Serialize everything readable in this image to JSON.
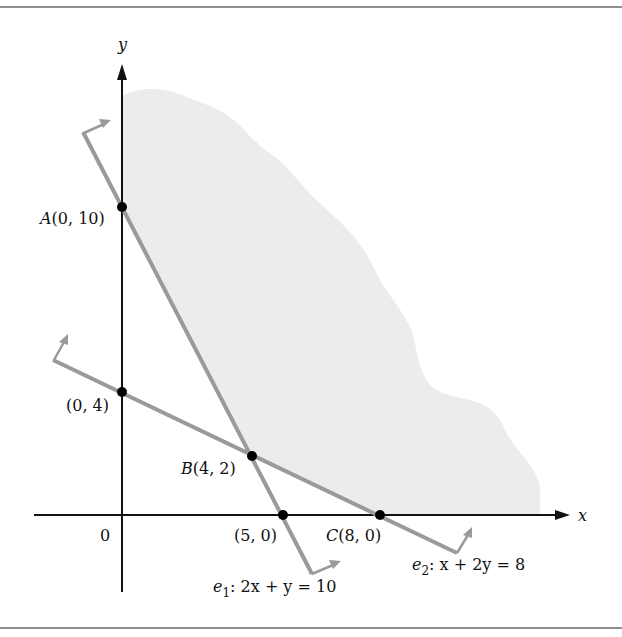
{
  "figure": {
    "axes": {
      "x_label": "x",
      "y_label": "y",
      "origin_label": "0"
    },
    "points": [
      {
        "id": "A",
        "name": "A",
        "coords": "(0, 10)",
        "x": 0,
        "y": 10
      },
      {
        "id": "P04",
        "name": "",
        "coords": "(0, 4)",
        "x": 0,
        "y": 4
      },
      {
        "id": "B",
        "name": "B",
        "coords": "(4, 2)",
        "x": 4,
        "y": 2
      },
      {
        "id": "P50",
        "name": "",
        "coords": "(5, 0)",
        "x": 5,
        "y": 0
      },
      {
        "id": "C",
        "name": "C",
        "coords": "(8, 0)",
        "x": 8,
        "y": 0
      }
    ],
    "lines": [
      {
        "id": "e1",
        "name": "e",
        "sub": "1",
        "equation": ": 2x + y = 10"
      },
      {
        "id": "e2",
        "name": "e",
        "sub": "2",
        "equation": ": x + 2y = 8"
      }
    ],
    "region": "feasible region (shaded, unbounded)",
    "colors": {
      "shading": "#ececec",
      "constraint_line": "#9a9a9a",
      "axis": "#111111",
      "border": "#8f8f8f"
    }
  }
}
